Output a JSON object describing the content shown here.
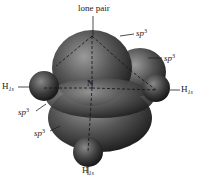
{
  "diagram": {
    "labels": {
      "top": "lone pair",
      "center": "N",
      "hybrid_base": "sp",
      "hybrid_sup": "3",
      "hydrogen_base": "H",
      "hydrogen_sub": "1s"
    },
    "colors": {
      "orbital_dark": "#1a1a1a",
      "orbital_mid": "#555555",
      "orbital_light": "#9a9a9a",
      "label": "#222222",
      "background": "#ffffff"
    }
  }
}
